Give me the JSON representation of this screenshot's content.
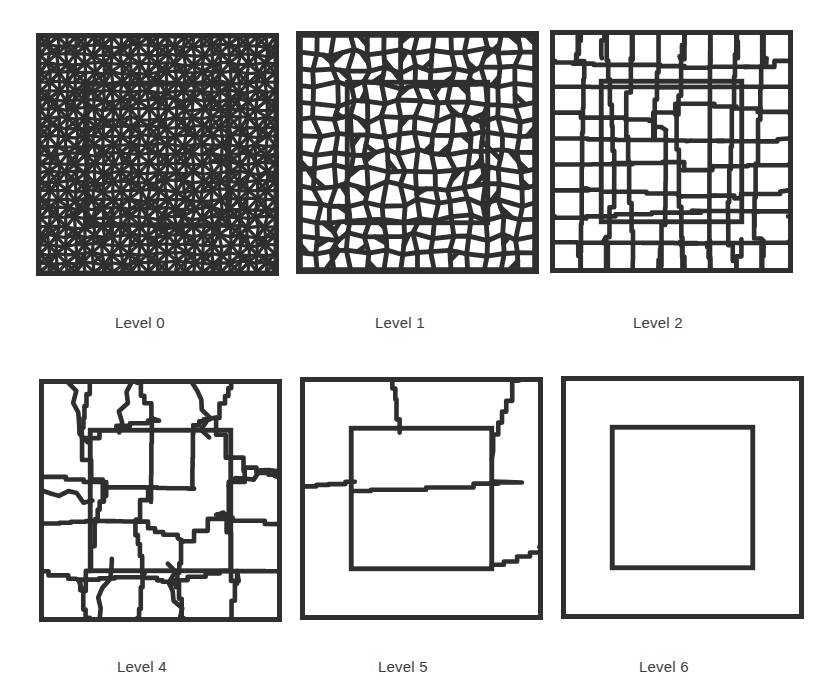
{
  "figure": {
    "background_color": "#ffffff",
    "line_color": "#2f2f2f",
    "caption_color": "#3d3d3d",
    "rows": 2,
    "columns": 3
  },
  "panels": [
    {
      "id": "level-0",
      "caption": "Level 0",
      "row": 0,
      "column": 0,
      "size_px": 243,
      "description": "fine unstructured triangular mesh over unit square",
      "mesh_kind": "triangular",
      "line_weight": "fine",
      "subdomain_visible": true,
      "subdomain_rect": [
        0.205,
        0.205,
        0.59,
        0.59
      ]
    },
    {
      "id": "level-1",
      "caption": "Level 1",
      "row": 0,
      "column": 1,
      "size_px": 243,
      "description": "first aggregation level, small polygonal aggregates",
      "mesh_kind": "polygonal",
      "line_weight": "mid",
      "subdomain_visible": true,
      "subdomain_rect": [
        0.205,
        0.205,
        0.59,
        0.59
      ]
    },
    {
      "id": "level-2",
      "caption": "Level 2",
      "row": 0,
      "column": 2,
      "size_px": 243,
      "description": "second aggregation level, medium polygonal aggregates",
      "mesh_kind": "polygonal",
      "line_weight": "coarse",
      "subdomain_visible": true,
      "subdomain_rect": [
        0.205,
        0.205,
        0.59,
        0.59
      ]
    },
    {
      "id": "level-4",
      "caption": "Level 4",
      "row": 1,
      "column": 0,
      "size_px": 243,
      "description": "fourth aggregation level, large irregular aggregates",
      "mesh_kind": "aggregate",
      "line_weight": "plain",
      "subdomain_visible": true,
      "subdomain_rect": [
        0.205,
        0.205,
        0.59,
        0.59
      ]
    },
    {
      "id": "level-5",
      "caption": "Level 5",
      "row": 1,
      "column": 1,
      "size_px": 243,
      "description": "fifth aggregation level, only a few aggregates remain",
      "mesh_kind": "aggregate",
      "line_weight": "plain",
      "subdomain_visible": true,
      "subdomain_rect": [
        0.205,
        0.205,
        0.59,
        0.59
      ]
    },
    {
      "id": "level-6",
      "caption": "Level 6",
      "row": 1,
      "column": 2,
      "size_px": 243,
      "description": "coarsest level, single aggregate plus subdomain outline",
      "mesh_kind": "none",
      "line_weight": "plain",
      "subdomain_visible": true,
      "subdomain_rect": [
        0.205,
        0.205,
        0.59,
        0.59
      ]
    }
  ],
  "chart_data": {
    "type": "diagram",
    "categories": [
      "Level 0",
      "Level 1",
      "Level 2",
      "Level 4",
      "Level 5",
      "Level 6"
    ],
    "panel_count": 6,
    "grid": "2 rows x 3 columns",
    "domain": "unit square",
    "subdomain": "inner square, approx 59% of side length, offset 20.5% from left and bottom"
  }
}
